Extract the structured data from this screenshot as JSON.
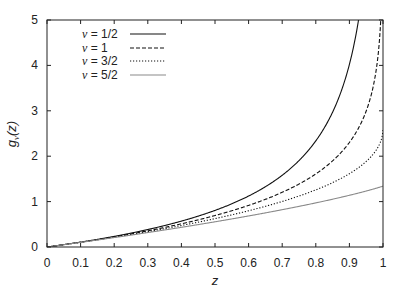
{
  "chart_data": {
    "type": "line",
    "title": "",
    "xlabel": "z",
    "ylabel": "g_ν(z)",
    "ylabel_parts": {
      "main": "g",
      "sub": "ν",
      "arg": "(z)"
    },
    "xlim": [
      0,
      1
    ],
    "ylim": [
      0,
      5
    ],
    "grid": false,
    "legend_position": "upper-left",
    "x_ticks": [
      "0",
      "0.1",
      "0.2",
      "0.3",
      "0.4",
      "0.5",
      "0.6",
      "0.7",
      "0.8",
      "0.9",
      "1"
    ],
    "y_ticks": [
      "0",
      "1",
      "2",
      "3",
      "4",
      "5"
    ],
    "x": [
      0,
      0.1,
      0.2,
      0.3,
      0.4,
      0.5,
      0.6,
      0.7,
      0.8,
      0.9,
      1.0
    ],
    "series": [
      {
        "name": "ν = 1/2",
        "nu_label": "ν",
        "value_label": " = 1/2",
        "order": 0.5,
        "style": "solid",
        "color": "#111111",
        "values": [
          0,
          0.105,
          0.221,
          0.351,
          0.502,
          0.68,
          0.898,
          1.182,
          1.58,
          2.238,
          null
        ],
        "note": "diverges; exits top (5) near z≈0.93"
      },
      {
        "name": "ν = 1",
        "nu_label": "ν",
        "value_label": " = 1",
        "order": 1,
        "style": "dashed",
        "color": "#111111",
        "values": [
          0,
          0.105,
          0.223,
          0.357,
          0.511,
          0.693,
          0.916,
          1.204,
          1.609,
          2.303,
          null
        ],
        "note": "diverges at z=1; reaches 5 near z≈0.993"
      },
      {
        "name": "ν = 3/2",
        "nu_label": "ν",
        "value_label": " = 3/2",
        "order": 1.5,
        "style": "dotted",
        "color": "#111111",
        "values": [
          0,
          0.104,
          0.214,
          0.336,
          0.469,
          0.617,
          0.784,
          0.976,
          1.205,
          1.501,
          2.612
        ]
      },
      {
        "name": "ν = 5/2",
        "nu_label": "ν",
        "value_label": " = 5/2",
        "order": 2.5,
        "style": "solid",
        "color": "#8a8a8a",
        "values": [
          0,
          0.102,
          0.207,
          0.317,
          0.432,
          0.552,
          0.679,
          0.813,
          0.956,
          1.111,
          1.341
        ]
      }
    ]
  },
  "layout": {
    "plot_left": 47,
    "plot_right": 383,
    "plot_top": 20,
    "plot_bottom": 247
  }
}
